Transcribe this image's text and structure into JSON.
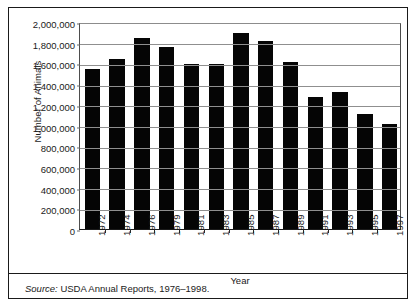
{
  "chart_data": {
    "type": "bar",
    "title": "",
    "subtitle": "",
    "xlabel": "Year",
    "ylabel": "Number of Animals",
    "categories": [
      "1972",
      "1974",
      "1976",
      "1979",
      "1981",
      "1983",
      "1985",
      "1987",
      "1989",
      "1991",
      "1993",
      "1995",
      "1997"
    ],
    "values": [
      1550000,
      1640000,
      1850000,
      1760000,
      1590000,
      1590000,
      1890000,
      1820000,
      1610000,
      1280000,
      1320000,
      1110000,
      1010000
    ],
    "series": [
      {
        "name": "Number of Animals",
        "values": [
          1550000,
          1640000,
          1850000,
          1760000,
          1590000,
          1590000,
          1890000,
          1820000,
          1610000,
          1280000,
          1320000,
          1110000,
          1010000
        ]
      }
    ],
    "ylim": [
      0,
      2000000
    ],
    "ytick_values": [
      0,
      200000,
      400000,
      600000,
      800000,
      1000000,
      1200000,
      1400000,
      1600000,
      1800000,
      2000000
    ],
    "ytick_labels": [
      "0",
      "200,000",
      "400,000",
      "600,000",
      "800,000",
      "1,000,000",
      "1,200,000",
      "1,400,000",
      "1,600,000",
      "1,800,000",
      "2,000,000"
    ],
    "grid": true,
    "legend": false,
    "legend_position": "none",
    "bar_color": "#050505",
    "gridline_color": "#8f8f8f",
    "annotations": []
  },
  "footer": {
    "source_lead": "Source:",
    "source_text": " USDA Annual Reports, 1976–1998."
  }
}
